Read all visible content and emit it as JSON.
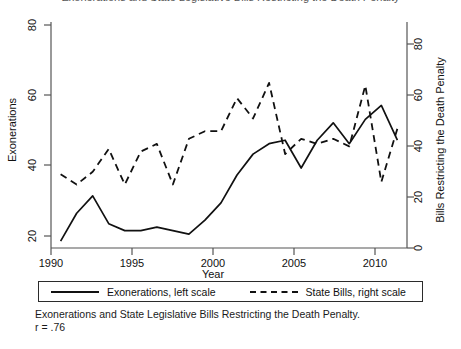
{
  "figure": {
    "clipped_title": "Exonerations and State Legislative Bills Restricting the Death Penalty",
    "caption_line1": "Exonerations and State Legislative Bills Restricting the Death Penalty.",
    "caption_line2": "r = .76"
  },
  "legend": {
    "entries": [
      {
        "label": "Exonerations, left scale",
        "style": "solid",
        "key_name": "solid-line-key"
      },
      {
        "label": "State Bills, right scale",
        "style": "dashed",
        "key_name": "dashed-line-key"
      }
    ]
  },
  "chart_data": {
    "type": "line",
    "title": "Exonerations and State Legislative Bills Restricting the Death Penalty",
    "xlabel": "Year",
    "ylabel": "Exonerations",
    "y2label": "Bills Restricting the Death Penalty",
    "grid": false,
    "legend_position": "bottom",
    "xlim": [
      1989.4,
      2011.6
    ],
    "ylim": [
      17,
      82
    ],
    "y2lim": [
      -3,
      86
    ],
    "xticks": [
      1990,
      1995,
      2000,
      2005,
      2010
    ],
    "yticks": [
      20,
      40,
      60,
      80
    ],
    "y2ticks": [
      0,
      20,
      40,
      60,
      80
    ],
    "x": [
      1990,
      1991,
      1992,
      1993,
      1994,
      1995,
      1996,
      1997,
      1998,
      1999,
      2000,
      2001,
      2002,
      2003,
      2004,
      2005,
      2006,
      2007,
      2008,
      2009,
      2010,
      2011
    ],
    "series": [
      {
        "name": "Exonerations, left scale",
        "axis": "left",
        "style": "solid",
        "values": [
          19,
          27,
          32,
          24,
          22,
          22,
          23,
          22,
          21,
          25,
          30,
          38,
          44,
          47,
          48,
          40,
          48,
          53,
          47,
          54,
          58,
          48
        ]
      },
      {
        "name": "State Bills, right scale",
        "axis": "right",
        "style": "dashed",
        "values": [
          26,
          22,
          27,
          36,
          22,
          35,
          38,
          22,
          40,
          43,
          43,
          56,
          48,
          62,
          34,
          40,
          38,
          40,
          37,
          61,
          23,
          44
        ]
      }
    ],
    "annotations": [
      "r = .76"
    ]
  },
  "axes": {
    "x_axis_label": "Year",
    "left_axis_label": "Exonerations",
    "right_axis_label": "Bills Restricting the Death Penalty",
    "x_tick_labels": [
      "1990",
      "1995",
      "2000",
      "2005",
      "2010"
    ],
    "left_tick_labels": [
      "80",
      "60",
      "40",
      "20"
    ],
    "right_tick_labels": [
      "80",
      "60",
      "40",
      "20",
      "0"
    ]
  },
  "colors": {
    "line": "#111111",
    "axis": "#555555",
    "background": "#ffffff"
  }
}
